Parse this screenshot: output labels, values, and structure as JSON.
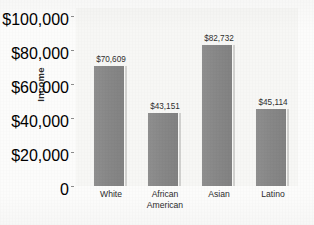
{
  "chart_data": {
    "type": "bar",
    "title": "",
    "xlabel": "",
    "ylabel": "Income",
    "categories": [
      "White",
      "African\nAmerican",
      "Asian",
      "Latino"
    ],
    "values": [
      70609,
      43151,
      82732,
      45114
    ],
    "value_labels": [
      "$70,609",
      "$43,151",
      "$82,732",
      "$45,114"
    ],
    "ylim": [
      0,
      100000
    ],
    "ytick_labels": [
      "$100,000",
      "$80,000",
      "$60,000",
      "$40,000",
      "$20,000",
      "0"
    ],
    "ytick_values": [
      100000,
      80000,
      60000,
      40000,
      20000,
      0
    ],
    "grid": false,
    "legend": false,
    "bar_color": "#8b8b8b",
    "bar_edge_color": "#d2d2d0",
    "plot_background": "#f7f7f5",
    "figure_background": "#fcfcfb",
    "text_color": "#2b2b2b"
  }
}
